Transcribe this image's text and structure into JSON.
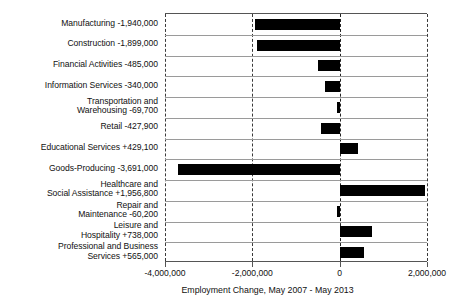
{
  "chart_data": {
    "type": "bar",
    "orientation": "horizontal",
    "title": "",
    "xlabel": "Employment Change, May 2007 - May 2013",
    "ylabel": "",
    "xlim": [
      -4000000,
      2000000
    ],
    "xticks": [
      -4000000,
      -2000000,
      0,
      2000000
    ],
    "xtick_labels": [
      "-4,000,000",
      "-2,000,000",
      "0",
      "2,000,000"
    ],
    "grid": true,
    "grid_style": "dashed-vertical",
    "legend": false,
    "bar_color": "#000000",
    "categories": [
      "Manufacturing",
      "Construction",
      "Financial Activities",
      "Information Services",
      "Transportation and\nWarehousing",
      "Retail",
      "Educational Services",
      "Goods-Producing",
      "Healthcare and\nSocial Assistance",
      "Repair and\nMaintenance",
      "Leisure and\nHospitality",
      "Professional and Business\nServices"
    ],
    "values": [
      -1940000,
      -1899000,
      -485000,
      -340000,
      -69700,
      -427900,
      429100,
      -3691000,
      1956800,
      -60200,
      738000,
      565000
    ],
    "value_labels": [
      "-1,940,000",
      "-1,899,000",
      "-485,000",
      "-340,000",
      "-69,700",
      "-427,900",
      "+429,100",
      "-3,691,000",
      "+1,956,800",
      "-60,200",
      "+738,000",
      "+565,000"
    ],
    "axis_labels": [
      "Manufacturing -1,940,000",
      "Construction -1,899,000",
      "Financial Activities -485,000",
      "Information Services -340,000",
      "Transportation and\nWarehousing -69,700",
      "Retail -427,900",
      "Educational Services +429,100",
      "Goods-Producing -3,691,000",
      "Healthcare and\nSocial Assistance +1,956,800",
      "Repair and\nMaintenance -60,200",
      "Leisure and\nHospitality +738,000",
      "Professional and Business\nServices +565,000"
    ]
  }
}
